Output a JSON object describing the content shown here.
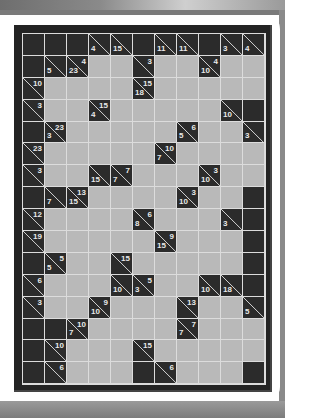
{
  "puzzle": {
    "type": "kakuro",
    "rows": 16,
    "cols": 11,
    "colors": {
      "empty_cell": "#b9b9b9",
      "block_cell": "#2b2b2b",
      "grid_line": "#dcdcdc",
      "clue_text": "#e8e8e8"
    },
    "grid": [
      [
        "B",
        "B",
        "B",
        {
          "d": 4
        },
        {
          "d": 15
        },
        "B",
        {
          "d": 11
        },
        {
          "d": 11
        },
        "B",
        {
          "d": 3
        },
        {
          "d": 4
        }
      ],
      [
        "B",
        {
          "d": 5
        },
        {
          "d": 23,
          "r": 4
        },
        "W",
        "W",
        {
          "r": 3
        },
        "W",
        "W",
        {
          "d": 10,
          "r": 4
        },
        "W",
        "W"
      ],
      [
        {
          "r": 10
        },
        "W",
        "W",
        "W",
        "W",
        {
          "d": 18,
          "r": 15
        },
        "W",
        "W",
        "W",
        "W",
        "W"
      ],
      [
        {
          "r": 3
        },
        "W",
        "W",
        {
          "d": 4,
          "r": 15
        },
        "W",
        "W",
        "W",
        "W",
        "W",
        {
          "d": 10
        },
        "B"
      ],
      [
        "B",
        {
          "d": 3,
          "r": 23
        },
        "W",
        "W",
        "W",
        "W",
        "W",
        {
          "d": 5,
          "r": 6
        },
        "W",
        "W",
        {
          "d": 3
        }
      ],
      [
        {
          "r": 23
        },
        "W",
        "W",
        "W",
        "W",
        "W",
        {
          "d": 7,
          "r": 10
        },
        "W",
        "W",
        "W",
        "W"
      ],
      [
        {
          "r": 3
        },
        "W",
        "W",
        {
          "d": 15
        },
        {
          "d": 7,
          "r": 7
        },
        "W",
        "W",
        "W",
        {
          "d": 10,
          "r": 3
        },
        "W",
        "W"
      ],
      [
        "B",
        {
          "d": 7
        },
        {
          "d": 15,
          "r": 13
        },
        "W",
        "W",
        "W",
        "W",
        {
          "d": 10,
          "r": 3
        },
        "W",
        "W",
        "B"
      ],
      [
        {
          "r": 12
        },
        "W",
        "W",
        "W",
        "W",
        {
          "d": 8,
          "r": 6
        },
        "W",
        "W",
        "W",
        {
          "d": 3
        },
        "B"
      ],
      [
        {
          "r": 19
        },
        "W",
        "W",
        "W",
        "W",
        "W",
        {
          "d": 15,
          "r": 9
        },
        "W",
        "W",
        "W",
        "B"
      ],
      [
        "B",
        {
          "d": 5,
          "r": 5
        },
        "W",
        "W",
        {
          "r": 15
        },
        "W",
        "W",
        "W",
        "W",
        "W",
        "B"
      ],
      [
        {
          "r": 6
        },
        "W",
        "W",
        "W",
        {
          "d": 10
        },
        {
          "d": 3,
          "r": 5
        },
        "W",
        "W",
        {
          "d": 10
        },
        {
          "d": 18
        },
        "B"
      ],
      [
        {
          "r": 3
        },
        "W",
        "W",
        {
          "d": 10,
          "r": 9
        },
        "W",
        "W",
        "W",
        {
          "r": 13
        },
        "W",
        "W",
        {
          "d": 5
        }
      ],
      [
        "B",
        "B",
        {
          "d": 7,
          "r": 10
        },
        "W",
        "W",
        "W",
        "W",
        {
          "d": 7,
          "r": 7
        },
        "W",
        "W",
        "W"
      ],
      [
        "B",
        {
          "r": 10
        },
        "W",
        "W",
        "W",
        {
          "r": 15
        },
        "W",
        "W",
        "W",
        "W",
        "W"
      ],
      [
        "B",
        {
          "r": 6
        },
        "W",
        "W",
        "W",
        "B",
        {
          "r": 6
        },
        "W",
        "W",
        "W",
        "B"
      ]
    ]
  }
}
